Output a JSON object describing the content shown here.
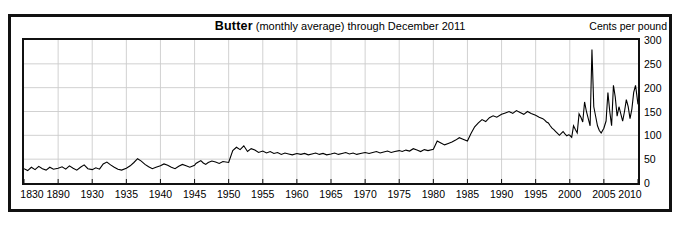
{
  "chart_data": {
    "type": "line",
    "title": "Butter (monthly average) through December 2011",
    "title_bold_part": "Butter",
    "title_rest_part": " (monthly average) through December 2011",
    "ylabel": "Cents per pound",
    "xlabel": "",
    "ylim": [
      0,
      300
    ],
    "y_ticks": [
      0,
      50,
      100,
      150,
      200,
      250,
      300
    ],
    "y_tick_labels": [
      "0",
      "50",
      "100",
      "150",
      "200",
      "250",
      "300"
    ],
    "x_tick_labels": [
      "1830",
      "1890",
      "1930",
      "1935",
      "1940",
      "1945",
      "1950",
      "1955",
      "1960",
      "1965",
      "1970",
      "1975",
      "1980",
      "1985",
      "1990",
      "1995",
      "2000",
      "2005",
      "2010"
    ],
    "x_tick_fractions": [
      0.0,
      0.0556,
      0.1111,
      0.1667,
      0.2222,
      0.2778,
      0.3333,
      0.3889,
      0.4444,
      0.5,
      0.5556,
      0.6111,
      0.6667,
      0.7222,
      0.7778,
      0.8333,
      0.8889,
      0.9444,
      1.0
    ],
    "grid": true,
    "grid_color": "#cccccc",
    "line_color": "#000000",
    "legend": "none",
    "series": [
      {
        "name": "Butter price (cents per pound)",
        "note": "x expressed as fraction 0..1 across the non-uniform axis (0 = 1830, 0.0556 = 1890, 0.1111 = 1930, then 5-year steps to 1.0 = 2010)",
        "x": [
          0.0,
          0.006,
          0.012,
          0.018,
          0.024,
          0.03,
          0.036,
          0.042,
          0.048,
          0.0556,
          0.062,
          0.068,
          0.074,
          0.08,
          0.086,
          0.092,
          0.098,
          0.104,
          0.1111,
          0.117,
          0.123,
          0.129,
          0.135,
          0.141,
          0.147,
          0.153,
          0.159,
          0.1667,
          0.173,
          0.179,
          0.185,
          0.191,
          0.197,
          0.203,
          0.209,
          0.215,
          0.2222,
          0.228,
          0.234,
          0.24,
          0.246,
          0.252,
          0.258,
          0.264,
          0.27,
          0.2778,
          0.28,
          0.284,
          0.288,
          0.292,
          0.296,
          0.3,
          0.306,
          0.312,
          0.318,
          0.324,
          0.3333,
          0.34,
          0.346,
          0.352,
          0.358,
          0.364,
          0.37,
          0.376,
          0.382,
          0.3889,
          0.395,
          0.401,
          0.407,
          0.413,
          0.419,
          0.425,
          0.431,
          0.437,
          0.4444,
          0.451,
          0.457,
          0.463,
          0.469,
          0.475,
          0.481,
          0.487,
          0.493,
          0.5,
          0.506,
          0.512,
          0.518,
          0.524,
          0.53,
          0.536,
          0.542,
          0.548,
          0.5556,
          0.562,
          0.568,
          0.574,
          0.58,
          0.586,
          0.592,
          0.598,
          0.604,
          0.6111,
          0.616,
          0.622,
          0.628,
          0.634,
          0.64,
          0.646,
          0.652,
          0.658,
          0.6667,
          0.673,
          0.679,
          0.685,
          0.691,
          0.697,
          0.703,
          0.709,
          0.715,
          0.7222,
          0.728,
          0.734,
          0.74,
          0.746,
          0.752,
          0.758,
          0.764,
          0.77,
          0.7778,
          0.784,
          0.79,
          0.796,
          0.802,
          0.808,
          0.814,
          0.82,
          0.826,
          0.8333,
          0.839,
          0.845,
          0.848,
          0.851,
          0.854,
          0.857,
          0.86,
          0.863,
          0.866,
          0.869,
          0.872,
          0.875,
          0.878,
          0.881,
          0.884,
          0.887,
          0.8889,
          0.892,
          0.895,
          0.898,
          0.901,
          0.904,
          0.907,
          0.91,
          0.913,
          0.916,
          0.919,
          0.922,
          0.925,
          0.928,
          0.931,
          0.934,
          0.937,
          0.94,
          0.9444,
          0.948,
          0.951,
          0.954,
          0.957,
          0.96,
          0.963,
          0.966,
          0.969,
          0.972,
          0.975,
          0.978,
          0.981,
          0.984,
          0.987,
          0.99,
          0.993,
          0.996,
          1.0
        ],
        "y": [
          30,
          26,
          33,
          28,
          35,
          30,
          27,
          33,
          29,
          31,
          34,
          29,
          36,
          31,
          27,
          33,
          38,
          30,
          28,
          32,
          29,
          40,
          44,
          38,
          33,
          29,
          27,
          31,
          36,
          43,
          51,
          46,
          39,
          34,
          30,
          33,
          36,
          40,
          37,
          33,
          30,
          35,
          39,
          36,
          33,
          37,
          41,
          44,
          47,
          42,
          39,
          43,
          46,
          44,
          41,
          45,
          43,
          68,
          75,
          70,
          78,
          66,
          72,
          69,
          64,
          67,
          63,
          66,
          62,
          64,
          60,
          63,
          61,
          59,
          62,
          60,
          62,
          59,
          61,
          63,
          60,
          62,
          59,
          61,
          63,
          60,
          62,
          64,
          61,
          63,
          60,
          62,
          64,
          62,
          64,
          66,
          63,
          65,
          67,
          64,
          66,
          68,
          66,
          69,
          67,
          72,
          69,
          66,
          70,
          68,
          71,
          88,
          84,
          80,
          83,
          86,
          90,
          95,
          92,
          88,
          104,
          118,
          126,
          133,
          129,
          137,
          141,
          138,
          144,
          147,
          150,
          146,
          152,
          148,
          144,
          150,
          146,
          142,
          138,
          135,
          132,
          128,
          126,
          120,
          115,
          112,
          108,
          104,
          100,
          104,
          108,
          103,
          99,
          101,
          100,
          96,
          120,
          112,
          105,
          145,
          138,
          128,
          170,
          150,
          135,
          120,
          280,
          160,
          140,
          120,
          110,
          105,
          115,
          130,
          190,
          150,
          120,
          205,
          180,
          140,
          160,
          145,
          130,
          150,
          175,
          160,
          135,
          155,
          190,
          205,
          165
        ],
        "peak": {
          "value": 280,
          "approx_year": 1998
        }
      }
    ],
    "annotations": []
  },
  "figure": {
    "title_bold": "Butter",
    "title_rest": " (monthly average) through December 2011",
    "unit_label": "Cents per pound",
    "background": "#ffffff",
    "frame_color": "#111111",
    "grid_color": "#cccccc",
    "series_color": "#000000"
  }
}
